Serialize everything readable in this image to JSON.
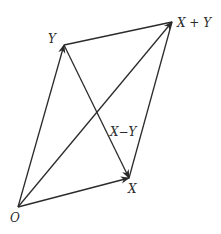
{
  "diagram": {
    "points": {
      "O": {
        "label": "O",
        "x": 18,
        "y": 207
      },
      "X": {
        "label": "X",
        "x": 129,
        "y": 178
      },
      "Y": {
        "label": "Y",
        "x": 64,
        "y": 45
      },
      "XplusY": {
        "label": "X + Y",
        "x": 172,
        "y": 22
      }
    },
    "edge_labels": {
      "XminusY": "X−Y"
    },
    "arrows": [
      {
        "from": "O",
        "to": "X",
        "arrowhead": true
      },
      {
        "from": "O",
        "to": "Y",
        "arrowhead": true
      },
      {
        "from": "O",
        "to": "XplusY",
        "arrowhead": true
      },
      {
        "from": "Y",
        "to": "X",
        "arrowhead": true,
        "label": "X−Y"
      }
    ],
    "lines": [
      {
        "from": "Y",
        "to": "XplusY"
      },
      {
        "from": "X",
        "to": "XplusY"
      }
    ],
    "colors": {
      "stroke": "#2b2b2b",
      "background": "#ffffff"
    }
  }
}
